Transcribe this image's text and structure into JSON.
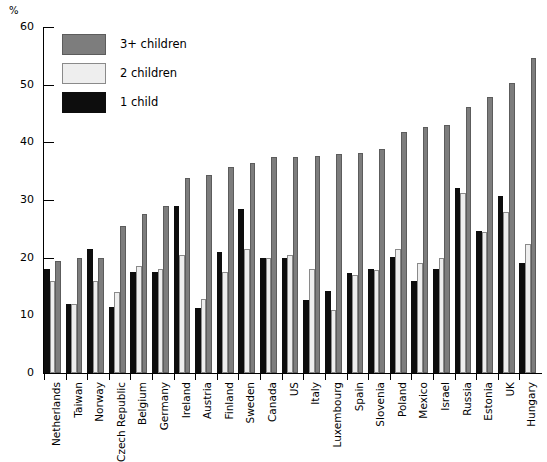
{
  "chart_data": {
    "type": "bar",
    "title": "",
    "xlabel": "",
    "ylabel": "%",
    "ylim": [
      0,
      60
    ],
    "yticks": [
      0,
      10,
      20,
      30,
      40,
      50,
      60
    ],
    "grid": false,
    "legend_position": "top-left",
    "categories": [
      "Netherlands",
      "Taiwan",
      "Norway",
      "Czech Republic",
      "Belgium",
      "Germany",
      "Ireland",
      "Austria",
      "Finland",
      "Sweden",
      "Canada",
      "US",
      "Italy",
      "Luxembourg",
      "Spain",
      "Slovenia",
      "Poland",
      "Mexico",
      "Israel",
      "Russia",
      "Estonia",
      "UK",
      "Hungary"
    ],
    "series": [
      {
        "name": "1 child",
        "color": "#0d0d0d",
        "values": [
          18.0,
          12.0,
          21.5,
          11.5,
          17.5,
          17.5,
          29.0,
          11.3,
          21.0,
          28.5,
          20.0,
          20.0,
          12.7,
          14.3,
          17.3,
          18.0,
          20.2,
          16.0,
          18.0,
          32.0,
          24.7,
          30.7,
          19.0
        ]
      },
      {
        "name": "2 children",
        "color": "#eeeeee",
        "values": [
          16.0,
          12.0,
          16.0,
          14.0,
          18.5,
          18.0,
          20.5,
          12.8,
          17.5,
          21.5,
          20.0,
          20.5,
          18.0,
          11.0,
          17.0,
          17.8,
          21.5,
          19.0,
          20.0,
          31.3,
          24.5,
          28.0,
          22.3
        ]
      },
      {
        "name": "3+ children",
        "color": "#7d7d7d",
        "values": [
          19.5,
          20.0,
          20.0,
          25.5,
          27.5,
          29.0,
          33.8,
          34.3,
          35.7,
          36.5,
          37.5,
          37.5,
          37.7,
          38.0,
          38.2,
          38.8,
          41.8,
          42.6,
          43.0,
          46.2,
          47.8,
          50.3,
          54.7
        ]
      }
    ]
  },
  "axis": {
    "unit_label": "%",
    "tick_labels": [
      "60",
      "50",
      "40",
      "30",
      "20",
      "10",
      "0"
    ]
  },
  "legend": {
    "items": [
      {
        "label": "3+ children",
        "swatch": "gray-swatch"
      },
      {
        "label": "2 children",
        "swatch": "light-swatch"
      },
      {
        "label": "1 child",
        "swatch": "black-swatch"
      }
    ]
  }
}
